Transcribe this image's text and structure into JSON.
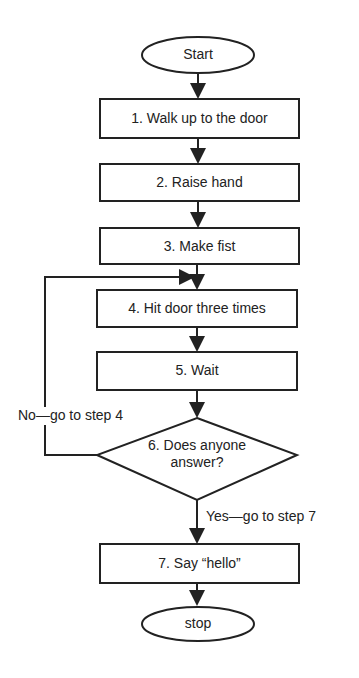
{
  "diagram": {
    "type": "flowchart",
    "start": "Start",
    "steps": [
      "1.  Walk up to the door",
      "2.  Raise hand",
      "3.  Make fist",
      "4.  Hit door three times",
      "5.  Wait"
    ],
    "decision": {
      "line1": "6.  Does anyone",
      "line2": "answer?"
    },
    "no_branch": "No—go to step 4",
    "yes_branch": "Yes—go to step 7",
    "final_step": "7.  Say “hello”",
    "end": "stop"
  }
}
